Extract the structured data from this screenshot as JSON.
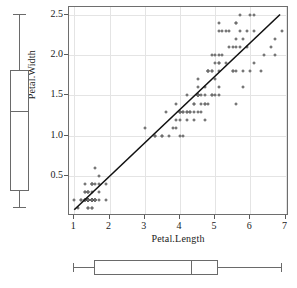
{
  "chart_data": {
    "type": "scatter",
    "title": "",
    "xlabel": "Petal.Length",
    "ylabel": "Petal.Width",
    "xlim": [
      0.85,
      7.1
    ],
    "ylim": [
      0.0,
      2.6
    ],
    "xticks": [
      "1",
      "2",
      "3",
      "4",
      "5",
      "6",
      "7"
    ],
    "xtick_values": [
      1,
      2,
      3,
      4,
      5,
      6,
      7
    ],
    "yticks": [
      "0.5",
      "1.0",
      "1.5",
      "2.0",
      "2.5"
    ],
    "ytick_values": [
      0.5,
      1.0,
      1.5,
      2.0,
      2.5
    ],
    "grid": true,
    "legend": "none",
    "marker": "open-circle",
    "marker_color": "#4a4a4a",
    "line_color": "#111111",
    "grid_color": "#e4e4e4",
    "panel_border_color": "#6e6e6e",
    "fit_line": {
      "type": "linear-regression",
      "slope": 0.4158,
      "intercept": -0.3631,
      "x_start": 1.0,
      "x_end": 6.9,
      "y_start": 0.053,
      "y_end": 2.506
    },
    "points": [
      [
        1.4,
        0.2
      ],
      [
        1.4,
        0.2
      ],
      [
        1.3,
        0.2
      ],
      [
        1.5,
        0.2
      ],
      [
        1.4,
        0.2
      ],
      [
        1.7,
        0.4
      ],
      [
        1.4,
        0.3
      ],
      [
        1.5,
        0.2
      ],
      [
        1.4,
        0.2
      ],
      [
        1.5,
        0.1
      ],
      [
        1.5,
        0.2
      ],
      [
        1.6,
        0.2
      ],
      [
        1.4,
        0.1
      ],
      [
        1.1,
        0.1
      ],
      [
        1.2,
        0.2
      ],
      [
        1.5,
        0.4
      ],
      [
        1.3,
        0.4
      ],
      [
        1.4,
        0.3
      ],
      [
        1.7,
        0.3
      ],
      [
        1.5,
        0.3
      ],
      [
        1.7,
        0.2
      ],
      [
        1.5,
        0.4
      ],
      [
        1.0,
        0.2
      ],
      [
        1.7,
        0.5
      ],
      [
        1.9,
        0.2
      ],
      [
        1.6,
        0.2
      ],
      [
        1.6,
        0.4
      ],
      [
        1.5,
        0.2
      ],
      [
        1.4,
        0.2
      ],
      [
        1.6,
        0.2
      ],
      [
        1.6,
        0.2
      ],
      [
        1.5,
        0.4
      ],
      [
        1.5,
        0.1
      ],
      [
        1.4,
        0.2
      ],
      [
        1.5,
        0.2
      ],
      [
        1.2,
        0.2
      ],
      [
        1.3,
        0.2
      ],
      [
        1.4,
        0.1
      ],
      [
        1.3,
        0.2
      ],
      [
        1.5,
        0.2
      ],
      [
        1.3,
        0.3
      ],
      [
        1.3,
        0.3
      ],
      [
        1.3,
        0.2
      ],
      [
        1.6,
        0.6
      ],
      [
        1.9,
        0.4
      ],
      [
        1.4,
        0.3
      ],
      [
        1.6,
        0.2
      ],
      [
        1.4,
        0.2
      ],
      [
        1.5,
        0.2
      ],
      [
        1.4,
        0.2
      ],
      [
        4.7,
        1.4
      ],
      [
        4.5,
        1.5
      ],
      [
        4.9,
        1.5
      ],
      [
        4.0,
        1.3
      ],
      [
        4.6,
        1.5
      ],
      [
        4.5,
        1.3
      ],
      [
        4.7,
        1.6
      ],
      [
        3.3,
        1.0
      ],
      [
        4.6,
        1.3
      ],
      [
        3.9,
        1.4
      ],
      [
        3.5,
        1.0
      ],
      [
        4.2,
        1.5
      ],
      [
        4.0,
        1.0
      ],
      [
        4.7,
        1.4
      ],
      [
        3.6,
        1.3
      ],
      [
        4.4,
        1.4
      ],
      [
        4.5,
        1.5
      ],
      [
        4.1,
        1.0
      ],
      [
        4.5,
        1.5
      ],
      [
        3.9,
        1.1
      ],
      [
        4.8,
        1.8
      ],
      [
        4.0,
        1.3
      ],
      [
        4.9,
        1.5
      ],
      [
        4.7,
        1.2
      ],
      [
        4.3,
        1.3
      ],
      [
        4.4,
        1.4
      ],
      [
        4.8,
        1.4
      ],
      [
        5.0,
        1.7
      ],
      [
        4.5,
        1.5
      ],
      [
        3.5,
        1.0
      ],
      [
        3.8,
        1.1
      ],
      [
        3.7,
        1.0
      ],
      [
        3.9,
        1.2
      ],
      [
        5.1,
        1.6
      ],
      [
        4.5,
        1.5
      ],
      [
        4.5,
        1.6
      ],
      [
        4.7,
        1.5
      ],
      [
        4.4,
        1.3
      ],
      [
        4.1,
        1.3
      ],
      [
        4.0,
        1.3
      ],
      [
        4.4,
        1.2
      ],
      [
        4.6,
        1.4
      ],
      [
        4.0,
        1.2
      ],
      [
        3.3,
        1.0
      ],
      [
        4.2,
        1.3
      ],
      [
        4.2,
        1.2
      ],
      [
        4.2,
        1.3
      ],
      [
        4.3,
        1.3
      ],
      [
        3.0,
        1.1
      ],
      [
        4.1,
        1.3
      ],
      [
        6.0,
        2.5
      ],
      [
        5.1,
        1.9
      ],
      [
        5.9,
        2.1
      ],
      [
        5.6,
        1.8
      ],
      [
        5.8,
        2.2
      ],
      [
        6.6,
        2.1
      ],
      [
        4.5,
        1.7
      ],
      [
        6.3,
        1.8
      ],
      [
        5.8,
        1.8
      ],
      [
        6.1,
        2.5
      ],
      [
        5.1,
        2.0
      ],
      [
        5.3,
        1.9
      ],
      [
        5.5,
        2.1
      ],
      [
        5.0,
        2.0
      ],
      [
        5.1,
        2.4
      ],
      [
        5.3,
        2.3
      ],
      [
        5.5,
        1.8
      ],
      [
        6.7,
        2.2
      ],
      [
        6.9,
        2.3
      ],
      [
        5.0,
        1.5
      ],
      [
        5.7,
        2.3
      ],
      [
        4.9,
        2.0
      ],
      [
        6.7,
        2.0
      ],
      [
        4.9,
        1.8
      ],
      [
        5.7,
        2.1
      ],
      [
        6.0,
        1.8
      ],
      [
        4.8,
        1.8
      ],
      [
        4.9,
        1.8
      ],
      [
        5.6,
        2.1
      ],
      [
        5.8,
        1.6
      ],
      [
        6.1,
        1.9
      ],
      [
        6.4,
        2.0
      ],
      [
        5.6,
        2.2
      ],
      [
        5.1,
        1.5
      ],
      [
        5.6,
        1.4
      ],
      [
        6.1,
        2.3
      ],
      [
        5.6,
        2.4
      ],
      [
        5.5,
        1.8
      ],
      [
        4.8,
        1.8
      ],
      [
        5.4,
        2.1
      ],
      [
        5.6,
        2.4
      ],
      [
        5.1,
        2.3
      ],
      [
        5.1,
        1.9
      ],
      [
        5.9,
        2.3
      ],
      [
        5.7,
        2.5
      ],
      [
        5.2,
        2.3
      ],
      [
        5.0,
        1.9
      ],
      [
        5.2,
        2.0
      ],
      [
        5.4,
        2.3
      ],
      [
        5.1,
        1.8
      ]
    ],
    "marginal_boxplots": [
      {
        "name": "petal-width-boxplot",
        "orientation": "vertical",
        "variable": "Petal.Width",
        "min": 0.1,
        "q1": 0.3,
        "median": 1.3,
        "q3": 1.8,
        "max": 2.5
      },
      {
        "name": "petal-length-boxplot",
        "orientation": "horizontal",
        "variable": "Petal.Length",
        "min": 1.0,
        "q1": 1.6,
        "median": 4.35,
        "q3": 5.1,
        "max": 6.9
      }
    ]
  }
}
